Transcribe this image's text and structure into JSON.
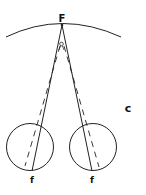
{
  "diagram": {
    "labels": {
      "fixation_point": "F",
      "left_fovea": "f",
      "right_fovea": "f",
      "panel": "c"
    },
    "colors": {
      "stroke": "#222222",
      "background": "#ffffff"
    }
  }
}
